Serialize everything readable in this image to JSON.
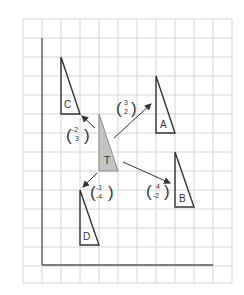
{
  "diagram": {
    "type": "translation-vectors-grid",
    "grid": {
      "columns": 11,
      "rows": 14,
      "cell_px": 19
    },
    "shapes": {
      "T": {
        "label": "T",
        "shaded": true
      },
      "A": {
        "label": "A"
      },
      "B": {
        "label": "B"
      },
      "C": {
        "label": "C"
      },
      "D": {
        "label": "D"
      }
    },
    "vectors": [
      {
        "to": "A",
        "top": "3",
        "bottom": "2"
      },
      {
        "to": "B",
        "top": "4",
        "bottom": "-2"
      },
      {
        "to": "C",
        "top": "-2",
        "bottom": "3"
      },
      {
        "to": "D",
        "top": "-1",
        "bottom": "-4"
      }
    ],
    "colors": {
      "grid": "#d4d4d4",
      "outline": "#333333",
      "shade": "#c4c4c4"
    }
  }
}
